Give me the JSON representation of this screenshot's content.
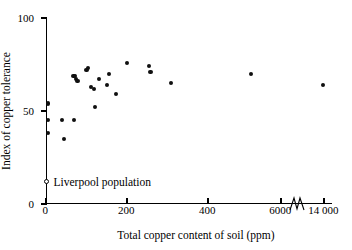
{
  "chart_data": {
    "type": "scatter",
    "title": "",
    "xlabel": "Total copper content of soil (ppm)",
    "ylabel": "Index of copper tolerance",
    "xticklabels": [
      "0",
      "200",
      "400",
      "6000",
      "14 000"
    ],
    "xtickvalues": [
      0,
      200,
      400,
      6000,
      14000
    ],
    "yticklabels": [
      "0",
      "50",
      "100"
    ],
    "ytickvalues": [
      0,
      50,
      100
    ],
    "ylim": [
      0,
      100
    ],
    "grid": false,
    "axis_break": true,
    "axis_break_note": "x-axis broken between 400 and 6000 ppm; scale compressed after the break",
    "legend_position": "inside-lower-left",
    "legend": [
      {
        "label": "Liverpool population",
        "marker": "open-circle"
      }
    ],
    "series": [
      {
        "name": "Copper tolerance of populations",
        "marker": "filled-circle",
        "points": [
          {
            "x": 5,
            "y": 54
          },
          {
            "x": 5,
            "y": 45
          },
          {
            "x": 5,
            "y": 38
          },
          {
            "x": 40,
            "y": 45
          },
          {
            "x": 45,
            "y": 35
          },
          {
            "x": 70,
            "y": 45
          },
          {
            "x": 68,
            "y": 69
          },
          {
            "x": 72,
            "y": 69
          },
          {
            "x": 74,
            "y": 67
          },
          {
            "x": 78,
            "y": 66
          },
          {
            "x": 100,
            "y": 72
          },
          {
            "x": 103,
            "y": 73
          },
          {
            "x": 112,
            "y": 63
          },
          {
            "x": 118,
            "y": 62
          },
          {
            "x": 120,
            "y": 52
          },
          {
            "x": 130,
            "y": 67
          },
          {
            "x": 150,
            "y": 64
          },
          {
            "x": 155,
            "y": 70
          },
          {
            "x": 172,
            "y": 59
          },
          {
            "x": 200,
            "y": 76
          },
          {
            "x": 255,
            "y": 74
          },
          {
            "x": 258,
            "y": 71
          },
          {
            "x": 308,
            "y": 65
          },
          {
            "x": 435,
            "y": 70
          },
          {
            "x": 13800,
            "y": 64
          }
        ]
      },
      {
        "name": "Liverpool population",
        "marker": "open-circle",
        "points": [
          {
            "x": 0,
            "y": 12
          }
        ]
      }
    ]
  }
}
